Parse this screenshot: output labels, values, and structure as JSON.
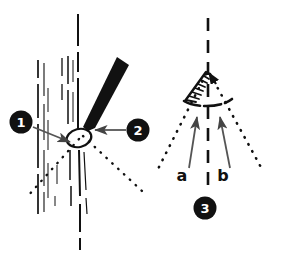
{
  "figure": {
    "background_color": "#ffffff",
    "ink_color": "#111111",
    "width": 289,
    "height": 260
  },
  "callouts": [
    {
      "id": "callout-1",
      "label": "1",
      "cx": 21,
      "cy": 122,
      "r": 11.5,
      "arrow": {
        "x1": 32,
        "y1": 127,
        "x2": 71,
        "y2": 141
      }
    },
    {
      "id": "callout-2",
      "label": "2",
      "cx": 138,
      "cy": 130,
      "r": 11.5,
      "arrow": {
        "x1": 126,
        "y1": 130,
        "x2": 92,
        "y2": 130
      }
    },
    {
      "id": "callout-3",
      "label": "3",
      "cx": 205,
      "cy": 208,
      "r": 11.5,
      "arrow": null
    }
  ],
  "labels": [
    {
      "id": "label-a",
      "text": "a",
      "x": 182,
      "y": 180
    },
    {
      "id": "label-b",
      "text": "b",
      "x": 223,
      "y": 180
    }
  ],
  "left_panel": {
    "name": "left-specimen-panel",
    "description": "Vertical fibrous strands with a dark tapered wedge entering at an angle and a dotted V spreading downward from the contact point",
    "vertical_strands": [
      {
        "x": 38,
        "y1": 60,
        "y2": 215,
        "width": 1.6
      },
      {
        "x": 44,
        "y1": 62,
        "y2": 212,
        "width": 1.1
      },
      {
        "x": 48,
        "y1": 88,
        "y2": 200,
        "width": 1.1
      },
      {
        "x": 62,
        "y1": 58,
        "y2": 100,
        "width": 1.3
      },
      {
        "x": 68,
        "y1": 55,
        "y2": 205,
        "width": 1.6
      },
      {
        "x": 78,
        "y1": 14,
        "y2": 250,
        "width": 2.0
      }
    ],
    "wedge": {
      "name": "dark-wedge",
      "points": "119,58 128,66 92,130 82,127"
    },
    "ellipse_marker": {
      "name": "contact-ellipse",
      "cx": 79,
      "cy": 137,
      "rx": 12,
      "ry": 9,
      "rotation": -12
    },
    "dotted_v": {
      "apex_x": 80,
      "apex_y": 136,
      "left_x": 27,
      "left_y": 196,
      "right_x": 141,
      "right_y": 190
    }
  },
  "right_panel": {
    "name": "right-schematic-panel",
    "description": "Dashed vertical axis with a dotted V, a hatched angular sector at the apex, an arc spanning the sector and two arrows labeled a and b",
    "dashed_axis": {
      "x": 208,
      "y1": 18,
      "y2": 190
    },
    "dotted_v": {
      "apex_x": 208,
      "apex_y": 72,
      "left_x": 157,
      "left_y": 170,
      "right_x": 262,
      "right_y": 170
    },
    "hatched_sector": {
      "name": "hatched-angle-sector",
      "apex_x": 208,
      "apex_y": 72,
      "edge_x": 186,
      "edge_y": 100
    },
    "arc": {
      "cx": 208,
      "cy": 72,
      "r": 28,
      "start_deg": 118,
      "end_deg": 62
    },
    "small_arrow": {
      "x1": 214,
      "y1": 78,
      "x2": 209,
      "y2": 73
    },
    "arrow_a": {
      "x1": 190,
      "y1": 170,
      "x2": 196,
      "y2": 116
    },
    "arrow_b": {
      "x1": 228,
      "y1": 170,
      "x2": 220,
      "y2": 116
    }
  }
}
